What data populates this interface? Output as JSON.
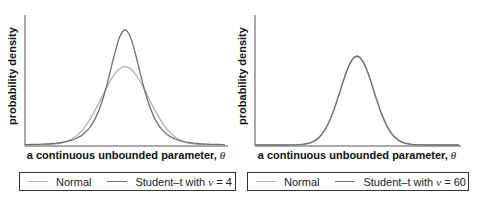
{
  "chart_data": [
    {
      "type": "line",
      "title": "",
      "xlabel": "a continuous unbounded parameter, θ",
      "ylabel": "probability density",
      "grid": false,
      "legend_position": "bottom",
      "x_range": [
        -6,
        6
      ],
      "series": [
        {
          "name": "Normal",
          "color": "#b0b0b0",
          "distribution": "normal",
          "mean": 0,
          "sd": 1.41,
          "relative_peak": 0.68
        },
        {
          "name": "Student–t with ν = 4",
          "color": "#707070",
          "distribution": "student-t",
          "df": 4,
          "relative_peak": 1.0
        }
      ]
    },
    {
      "type": "line",
      "title": "",
      "xlabel": "a continuous unbounded parameter, θ",
      "ylabel": "probability density",
      "grid": false,
      "legend_position": "bottom",
      "x_range": [
        -6,
        6
      ],
      "series": [
        {
          "name": "Normal",
          "color": "#b0b0b0",
          "distribution": "normal",
          "mean": 0,
          "sd": 1.0,
          "relative_peak": 0.99
        },
        {
          "name": "Student–t with ν = 60",
          "color": "#707070",
          "distribution": "student-t",
          "df": 60,
          "relative_peak": 1.0
        }
      ]
    }
  ],
  "panels": [
    {
      "ylabel": "probability density",
      "xlabel_text": "a continuous unbounded parameter, ",
      "xlabel_symbol": "θ",
      "legend": {
        "normal_label": "Normal",
        "t_label_prefix": "Student–t with ",
        "t_symbol": "ν",
        "t_label_suffix": " = 4"
      }
    },
    {
      "ylabel": "probability density",
      "xlabel_text": "a continuous unbounded parameter, ",
      "xlabel_symbol": "θ",
      "legend": {
        "normal_label": "Normal",
        "t_label_prefix": "Student–t with ",
        "t_symbol": "ν",
        "t_label_suffix": " = 60"
      }
    }
  ],
  "colors": {
    "normal": "#b0b0b0",
    "student_t": "#707070",
    "axis": "#555555"
  }
}
